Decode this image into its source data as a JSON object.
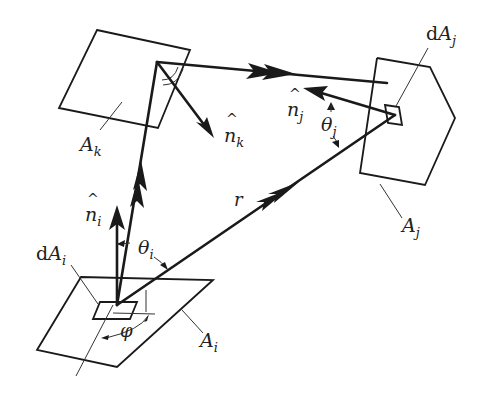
{
  "diagram": {
    "type": "radiosity-geometry",
    "colors": {
      "ink": "#1a1a1a",
      "background": "#ffffff"
    },
    "surfaces": [
      {
        "id": "Ai",
        "label": "A",
        "sub": "i"
      },
      {
        "id": "Aj",
        "label": "A",
        "sub": "j"
      },
      {
        "id": "Ak",
        "label": "A",
        "sub": "k"
      }
    ],
    "elements": [
      {
        "id": "dAi",
        "prefix": "d",
        "label": "A",
        "sub": "i"
      },
      {
        "id": "dAj",
        "prefix": "d",
        "label": "A",
        "sub": "j"
      }
    ],
    "normals": [
      {
        "id": "ni",
        "label": "n",
        "hat": "^",
        "sub": "i"
      },
      {
        "id": "nj",
        "label": "n",
        "hat": "^",
        "sub": "j"
      },
      {
        "id": "nk",
        "label": "n",
        "hat": "^",
        "sub": "k"
      }
    ],
    "angles": [
      {
        "id": "theta_i",
        "label": "θ",
        "sub": "i"
      },
      {
        "id": "theta_j",
        "label": "θ",
        "sub": "j"
      },
      {
        "id": "phi",
        "label": "φ"
      }
    ],
    "ray": {
      "label": "r"
    }
  }
}
